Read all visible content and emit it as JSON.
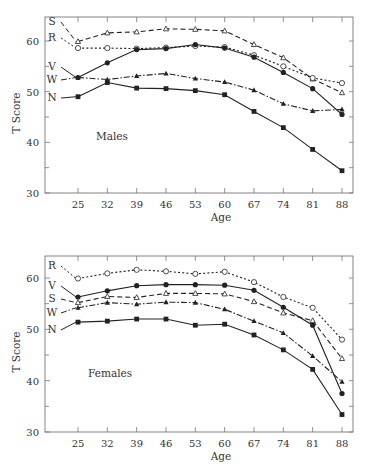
{
  "chart_data": [
    {
      "type": "line",
      "title": "Males",
      "xlabel": "Age",
      "ylabel": "T Score",
      "x": [
        25,
        32,
        39,
        46,
        53,
        60,
        67,
        74,
        81,
        88
      ],
      "ylim": [
        30,
        65
      ],
      "yticks": [
        30,
        40,
        50,
        60
      ],
      "grid": false,
      "legend_position": "inline labels at left of lines",
      "series": [
        {
          "name": "S",
          "marker": "open-triangle",
          "line": "dashed",
          "values": [
            59.9,
            61.6,
            61.8,
            62.4,
            62.3,
            62.0,
            59.3,
            56.7,
            52.5,
            49.8
          ]
        },
        {
          "name": "R",
          "marker": "open-circle",
          "line": "dotted",
          "values": [
            58.6,
            58.6,
            58.5,
            58.7,
            59.0,
            58.8,
            57.2,
            55.0,
            52.7,
            51.7
          ]
        },
        {
          "name": "V",
          "marker": "filled-circle",
          "line": "solid",
          "values": [
            52.8,
            55.7,
            58.3,
            58.5,
            59.3,
            58.6,
            56.8,
            53.8,
            50.6,
            45.5
          ]
        },
        {
          "name": "W",
          "marker": "filled-triangle",
          "line": "dash-dot",
          "values": [
            52.8,
            52.4,
            53.1,
            53.6,
            52.6,
            51.9,
            50.3,
            47.6,
            46.2,
            46.5
          ]
        },
        {
          "name": "N",
          "marker": "filled-square",
          "line": "solid",
          "values": [
            49.0,
            51.8,
            50.7,
            50.6,
            50.2,
            49.4,
            46.1,
            42.9,
            38.6,
            34.4
          ]
        }
      ]
    },
    {
      "type": "line",
      "title": "Females",
      "xlabel": "Age",
      "ylabel": "T Score",
      "x": [
        25,
        32,
        39,
        46,
        53,
        60,
        67,
        74,
        81,
        88
      ],
      "ylim": [
        30,
        65
      ],
      "yticks": [
        30,
        40,
        50,
        60
      ],
      "grid": false,
      "legend_position": "inline labels at left of lines",
      "series": [
        {
          "name": "R",
          "marker": "open-circle",
          "line": "dotted",
          "values": [
            59.9,
            60.9,
            61.6,
            61.3,
            60.8,
            61.2,
            59.2,
            56.3,
            54.2,
            48.0
          ]
        },
        {
          "name": "V",
          "marker": "filled-circle",
          "line": "solid",
          "values": [
            56.3,
            57.5,
            58.5,
            58.7,
            58.7,
            58.6,
            57.6,
            54.3,
            50.8,
            37.5
          ]
        },
        {
          "name": "S",
          "marker": "open-triangle",
          "line": "dashed",
          "values": [
            55.2,
            56.4,
            56.2,
            57.0,
            57.0,
            56.9,
            55.4,
            53.2,
            51.7,
            44.3
          ]
        },
        {
          "name": "W",
          "marker": "filled-triangle",
          "line": "dash-dot",
          "values": [
            54.2,
            55.2,
            54.9,
            55.3,
            55.2,
            53.9,
            51.6,
            49.3,
            44.8,
            39.8
          ]
        },
        {
          "name": "N",
          "marker": "filled-square",
          "line": "solid",
          "values": [
            51.4,
            51.6,
            52.0,
            52.0,
            50.8,
            51.0,
            48.9,
            46.0,
            42.2,
            33.4
          ]
        }
      ]
    }
  ],
  "labels": {
    "males": "Males",
    "females": "Females",
    "xlabel": "Age",
    "ylabel": "T Score"
  },
  "colors": {
    "line": "#222222",
    "axis": "#777777",
    "text": "#333333"
  }
}
